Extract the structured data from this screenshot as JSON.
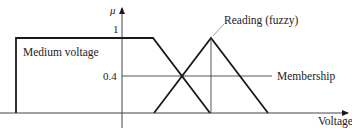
{
  "diagram": {
    "axis_y_label": "μ",
    "axis_x_label": "Voltage",
    "tick_1": "1",
    "tick_04": "0.4",
    "set_label": "Medium voltage",
    "reading_label": "Reading (fuzzy)",
    "membership_label": "Membership",
    "colors": {
      "line": "#1a1a1a",
      "thin": "#444444",
      "text": "#222222"
    }
  }
}
